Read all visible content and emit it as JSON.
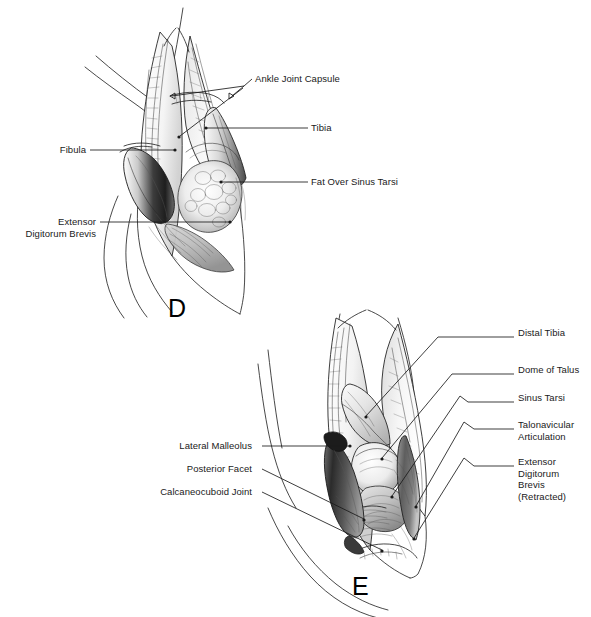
{
  "figure": {
    "panels": [
      {
        "letter": "D",
        "name": "panel-d",
        "description": "Lateral ankle exposure showing fibula, tibia and ankle joint capsule with sinus tarsi fat pad",
        "labels": [
          {
            "id": "ankle-joint-capsule",
            "text": "Ankle Joint Capsule",
            "side": "right"
          },
          {
            "id": "tibia",
            "text": "Tibia",
            "side": "right"
          },
          {
            "id": "fat-over-sinus-tarsi",
            "text": "Fat Over Sinus Tarsi",
            "side": "right"
          },
          {
            "id": "fibula",
            "text": "Fibula",
            "side": "left"
          },
          {
            "id": "extensor-digitorum-brevis",
            "text": "Extensor\nDigitorum Brevis",
            "side": "left"
          }
        ]
      },
      {
        "letter": "E",
        "name": "panel-e",
        "description": "Deeper lateral exposure showing distal tibia, dome of talus, sinus tarsi and subtalar joint facets",
        "labels": [
          {
            "id": "distal-tibia",
            "text": "Distal Tibia",
            "side": "right"
          },
          {
            "id": "dome-of-talus",
            "text": "Dome of Talus",
            "side": "right"
          },
          {
            "id": "sinus-tarsi",
            "text": "Sinus Tarsi",
            "side": "right"
          },
          {
            "id": "talonavicular-articulation",
            "text": "Talonavicular\nArticulation",
            "side": "right"
          },
          {
            "id": "extensor-digitorum-brevis-retracted",
            "text": "Extensor\nDigitorum\nBrevis\n(Retracted)",
            "side": "right"
          },
          {
            "id": "lateral-malleolus",
            "text": "Lateral Malleolus",
            "side": "left"
          },
          {
            "id": "posterior-facet",
            "text": "Posterior Facet",
            "side": "left"
          },
          {
            "id": "calcaneocuboid-joint",
            "text": "Calcaneocuboid Joint",
            "side": "left"
          }
        ]
      }
    ],
    "caption": "",
    "colors": {
      "background": "#ffffff",
      "ink": "#1a1a1a",
      "leader": "#1a1a1a",
      "shading": "#6b6b6b"
    }
  }
}
